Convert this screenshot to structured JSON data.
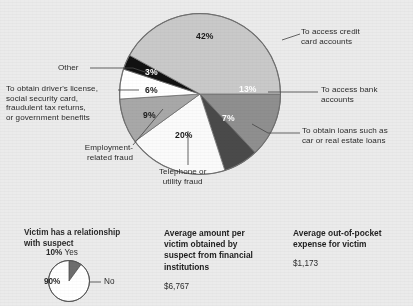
{
  "chart_data": {
    "type": "pie",
    "title": "",
    "categories": [
      "To access credit card accounts",
      "To access bank accounts",
      "To obtain loans such as car or real estate loans",
      "Telephone or utility fraud",
      "Employment-related fraud",
      "To obtain driver's license, social security card, fraudulent tax returns, or government benefits",
      "Other"
    ],
    "values": [
      42,
      13,
      7,
      20,
      9,
      6,
      3
    ],
    "value_labels": [
      "42%",
      "13%",
      "7%",
      "20%",
      "9%",
      "6%",
      "3%"
    ],
    "colors": [
      "#c9c9c9",
      "#8f8f8f",
      "#4a4a4a",
      "#fbfbfb",
      "#a8a8a8",
      "#ffffff",
      "#111111"
    ],
    "legend": "callout-labels",
    "grid": false
  },
  "callouts": {
    "credit_card": {
      "line1": "To access credit",
      "line2": "card accounts"
    },
    "bank": {
      "line1": "To access bank",
      "line2": "accounts"
    },
    "loans": {
      "line1": "To obtain loans such as",
      "line2": "car or real estate loans"
    },
    "telephone": {
      "line1": "Telephone or",
      "line2": "utility fraud"
    },
    "employment": {
      "line1": "Employment-",
      "line2": "related fraud"
    },
    "license": {
      "line1": "To obtain driver's license,",
      "line2": "social security card,",
      "line3": "fraudulent tax returns,",
      "line4": "or government benefits"
    },
    "other": {
      "line1": "Other"
    }
  },
  "mini_chart": {
    "type": "pie",
    "title_line1": "Victim has a relationship",
    "title_line2": "with suspect",
    "categories": [
      "Yes",
      "No"
    ],
    "values": [
      10,
      90
    ],
    "colors": [
      "#6e6e6e",
      "#ffffff"
    ],
    "yes_pct": "10%",
    "yes_label": "Yes",
    "no_pct": "90%",
    "no_label": "No"
  },
  "stats": [
    {
      "title_line1": "Average amount per",
      "title_line2": "victim obtained by",
      "title_line3": "suspect from financial",
      "title_line4": "institutions",
      "value": "$6,767"
    },
    {
      "title_line1": "Average out-of-pocket",
      "title_line2": "expense for victim",
      "value": "$1,173"
    }
  ]
}
